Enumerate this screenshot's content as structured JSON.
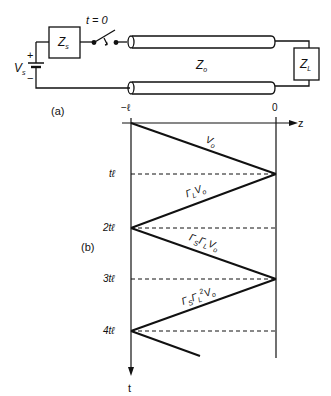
{
  "circuit": {
    "source_label": "V",
    "source_sub": "s",
    "plus": "+",
    "minus": "−",
    "source_impedance": "Z",
    "source_impedance_sub": "s",
    "switch_label": "t = 0",
    "line_impedance": "Z",
    "line_impedance_sub": "o",
    "load_impedance": "Z",
    "load_impedance_sub": "L",
    "panel_label": "(a)"
  },
  "bounce_diagram": {
    "panel_label": "(b)",
    "z_axis_label": "z",
    "t_axis_label": "t",
    "z_ticks": [
      {
        "label": "−ℓ"
      },
      {
        "label": "0"
      }
    ],
    "t_ticks": [
      {
        "label": "tℓ"
      },
      {
        "label": "2tℓ"
      },
      {
        "label": "3tℓ"
      },
      {
        "label": "4tℓ"
      }
    ],
    "waves": [
      {
        "label": "Vo",
        "text": "V",
        "sub": "o"
      },
      {
        "label": "ΓL Vo",
        "text1": "Γ",
        "sub1": "L",
        "text2": "V",
        "sub2": "o"
      },
      {
        "label": "ΓS ΓL Vo",
        "text1": "Γ",
        "sub1": "S",
        "text2": "Γ",
        "sub2": "L",
        "text3": "V",
        "sub3": "o"
      },
      {
        "label": "ΓS ΓL² Vo",
        "text1": "Γ",
        "sub1": "S",
        "text2": "Γ",
        "sub2": "L",
        "sup2": "2",
        "text3": "V",
        "sub3": "o"
      }
    ]
  }
}
